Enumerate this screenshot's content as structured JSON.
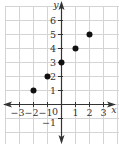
{
  "chart_data": {
    "type": "scatter",
    "title": "",
    "xlabel": "x",
    "ylabel": "y",
    "xlim": [
      -4,
      4
    ],
    "ylim": [
      -2,
      7
    ],
    "grid": true,
    "x_ticks": [
      -3,
      -2,
      -1,
      1,
      2,
      3
    ],
    "y_ticks": [
      -1,
      1,
      2,
      3,
      4,
      5,
      6
    ],
    "origin_label": "0",
    "series": [
      {
        "name": "points",
        "points": [
          {
            "x": -2,
            "y": 1
          },
          {
            "x": -1,
            "y": 2
          },
          {
            "x": 0,
            "y": 3
          },
          {
            "x": 1,
            "y": 4
          },
          {
            "x": 2,
            "y": 5
          }
        ]
      }
    ],
    "colors": {
      "grid": "#d4d4d4",
      "axis": "#333333",
      "point": "#111111",
      "text": "#333333"
    }
  },
  "layout": {
    "origin_px": [
      61,
      104
    ],
    "unit_px": 14
  }
}
